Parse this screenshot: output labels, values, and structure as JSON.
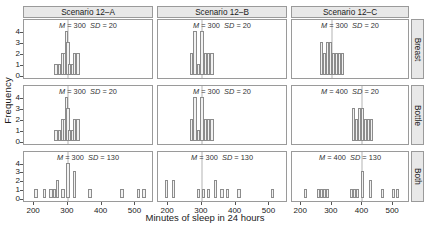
{
  "figure": {
    "xlabel": "Minutes of sleep in 24 hours",
    "ylabel": "Frequency"
  },
  "column_strips": [
    "Scenario 12–A",
    "Scenario 12–B",
    "Scenario 12–C"
  ],
  "row_strips": [
    "Breast",
    "Bottle",
    "Both"
  ],
  "axes": {
    "xticks": [
      200,
      300,
      400,
      500
    ],
    "xlim": [
      170,
      555
    ],
    "yticks": [
      0,
      1,
      2,
      3,
      4
    ],
    "ylim": [
      0,
      4.4
    ]
  },
  "chart_data": {
    "type": "bar",
    "title": "",
    "xlabel": "Minutes of sleep in 24 hours",
    "ylabel": "Frequency",
    "xlim": [
      170,
      555
    ],
    "ylim": [
      0,
      4.4
    ],
    "xticks": [
      200,
      300,
      400,
      500
    ],
    "yticks": [
      0,
      1,
      2,
      3,
      4
    ],
    "grid": false,
    "legend": "none",
    "layout": "3x3 trellis: columns = scenario, rows = feeding type",
    "bin_width": 10,
    "columns": [
      "Scenario 12–A",
      "Scenario 12–B",
      "Scenario 12–C"
    ],
    "rows": [
      "Breast",
      "Bottle",
      "Both"
    ],
    "panels": [
      {
        "column": "Scenario 12–A",
        "row": "Breast",
        "annotation": "M = 300   SD = 20",
        "mean": 300,
        "sd": 20,
        "bins": [
          265,
          275,
          285,
          290,
          295,
          300,
          305,
          310,
          315,
          320,
          330
        ],
        "counts": [
          1,
          1,
          2,
          2,
          4,
          3,
          1,
          1,
          1,
          2,
          2
        ]
      },
      {
        "column": "Scenario 12–A",
        "row": "Bottle",
        "annotation": "M = 300   SD = 20",
        "mean": 300,
        "sd": 20,
        "bins": [
          270,
          280,
          290,
          300,
          310,
          320,
          330
        ],
        "counts": [
          2,
          4,
          1,
          4,
          2,
          2,
          2
        ]
      },
      {
        "column": "Scenario 12–A",
        "row": "Both",
        "annotation": "M = 300   SD = 20",
        "mean": 300,
        "sd": 20,
        "bins": [
          265,
          275,
          285,
          295,
          305,
          315,
          325,
          335
        ],
        "counts": [
          3,
          2,
          3,
          3,
          2,
          2,
          2,
          2
        ]
      },
      {
        "column": "Scenario 12–B",
        "row": "Breast",
        "annotation": "M = 300   SD = 20",
        "mean": 300,
        "sd": 20,
        "bins": [
          265,
          275,
          285,
          290,
          295,
          300,
          305,
          310,
          315,
          320,
          330
        ],
        "counts": [
          1,
          1,
          2,
          2,
          4,
          3,
          1,
          1,
          1,
          2,
          2
        ]
      },
      {
        "column": "Scenario 12–B",
        "row": "Bottle",
        "annotation": "M = 300   SD = 20",
        "mean": 300,
        "sd": 20,
        "bins": [
          270,
          280,
          290,
          300,
          310,
          320,
          330
        ],
        "counts": [
          2,
          4,
          1,
          4,
          2,
          2,
          2
        ]
      },
      {
        "column": "Scenario 12–B",
        "row": "Both",
        "annotation": "M = 400   SD = 20",
        "mean": 400,
        "sd": 20,
        "bins": [
          370,
          380,
          390,
          400,
          410,
          420,
          430
        ],
        "counts": [
          3,
          2,
          3,
          3,
          2,
          2,
          2
        ]
      },
      {
        "column": "Scenario 12–C",
        "row": "Breast",
        "annotation": "M = 300   SD = 130",
        "mean": 300,
        "sd": 130,
        "bins": [
          205,
          230,
          250,
          260,
          270,
          285,
          300,
          320,
          365,
          410,
          460,
          510,
          525
        ],
        "counts": [
          1,
          1,
          1,
          1,
          2,
          1,
          4,
          3,
          1,
          0,
          1,
          1,
          1
        ]
      },
      {
        "column": "Scenario 12–C",
        "row": "Bottle",
        "annotation": "M = 300   SD = 130",
        "mean": 300,
        "sd": 130,
        "bins": [
          195,
          215,
          290,
          305,
          320,
          340,
          360,
          375,
          410,
          510
        ],
        "counts": [
          2,
          2,
          1,
          1,
          1,
          2,
          1,
          1,
          1,
          1
        ]
      },
      {
        "column": "Scenario 12–C",
        "row": "Both",
        "annotation": "M = 400   SD = 130",
        "mean": 400,
        "sd": 130,
        "bins": [
          215,
          255,
          265,
          275,
          285,
          365,
          375,
          385,
          400,
          425,
          465,
          500,
          515
        ],
        "counts": [
          1,
          1,
          1,
          1,
          1,
          1,
          1,
          1,
          3,
          2,
          1,
          1,
          1
        ]
      }
    ]
  }
}
